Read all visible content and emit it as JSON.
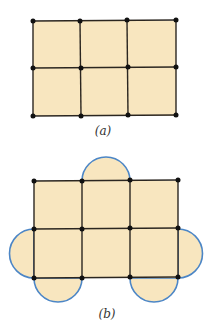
{
  "figure_a": {
    "label": "(a)",
    "grid": {
      "cols": 3,
      "rows": 2
    },
    "x": [
      33,
      81,
      128,
      176
    ],
    "y": [
      21,
      68,
      116
    ]
  },
  "figure_b": {
    "label": "(b)",
    "grid": {
      "cols": 3,
      "rows": 2
    },
    "x": [
      34,
      82,
      130,
      178
    ],
    "y": [
      181,
      229,
      278
    ],
    "semicircles": [
      {
        "position": "top",
        "on_cell": "row0-col1"
      },
      {
        "position": "left",
        "on_cell": "row1-col0"
      },
      {
        "position": "right",
        "on_cell": "row1-col2"
      },
      {
        "position": "bottom",
        "on_cell": "row1-col0"
      },
      {
        "position": "bottom",
        "on_cell": "row1-col2"
      }
    ]
  },
  "colors": {
    "fill": "#F8E6BF",
    "lines": "#2b2620",
    "arcs": "#4C86C6",
    "dots": "#111111"
  }
}
